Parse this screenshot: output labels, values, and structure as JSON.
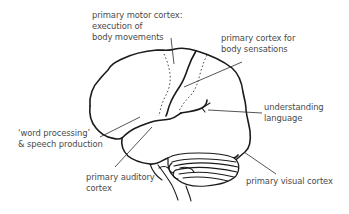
{
  "diagram": {
    "labels": {
      "motor_cortex": {
        "line1": "primary motor cortex:",
        "line2": "execution of",
        "line3": "body movements"
      },
      "sensory_cortex": {
        "line1": "primary cortex for",
        "line2": "body sensations"
      },
      "language_understanding": {
        "line1": "understanding",
        "line2": "language"
      },
      "word_processing": {
        "line1": "‘word processing’",
        "line2": "& speech production"
      },
      "auditory_cortex": {
        "line1": "primary auditory",
        "line2": "cortex"
      },
      "visual_cortex": {
        "line1": "primary visual cortex"
      }
    },
    "colors": {
      "line": "#1a1a1a",
      "text": "#4a4a4a",
      "background": "#ffffff"
    }
  }
}
